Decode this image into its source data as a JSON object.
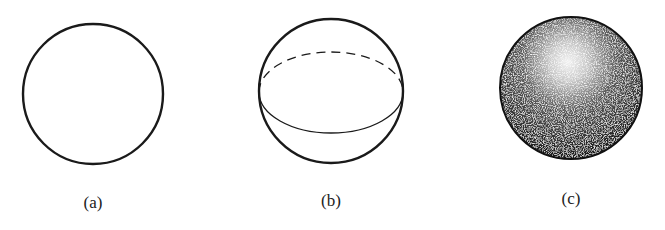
{
  "figure": {
    "panels": [
      {
        "id": "a",
        "label": "(a)",
        "description": "plain circle outline"
      },
      {
        "id": "b",
        "label": "(b)",
        "description": "sphere with dashed back equator and solid front equator"
      },
      {
        "id": "c",
        "label": "(c)",
        "description": "stippled shaded sphere with highlight at upper center"
      }
    ]
  },
  "colors": {
    "background": "#ffffff",
    "stroke": "#1a1a1a",
    "shade_dark": "#111111",
    "highlight": "#ffffff"
  }
}
